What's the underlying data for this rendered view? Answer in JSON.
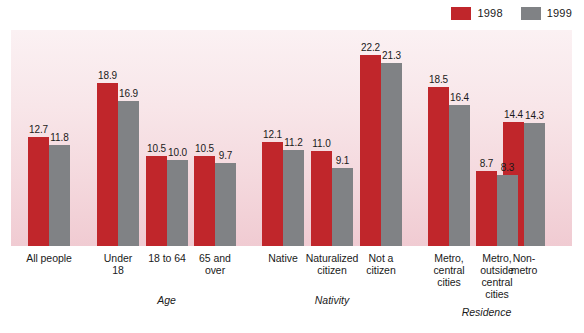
{
  "legend": {
    "items": [
      {
        "label": "1998",
        "color": "#c0262b",
        "name": "legend-swatch-1998"
      },
      {
        "label": "1999",
        "color": "#808285",
        "name": "legend-swatch-1999"
      }
    ]
  },
  "chart_data": {
    "type": "bar",
    "title": "",
    "subtitle": "",
    "xlabel": "",
    "ylabel": "",
    "ylim": [
      0,
      25
    ],
    "grid": false,
    "legend_position": "top-right",
    "categories": [
      "All people",
      "Under 18",
      "18 to 64",
      "65 and over",
      "Native",
      "Naturalized citizen",
      "Not a citizen",
      "Metro, central cities",
      "Metro, outside central cities",
      "Non-metro"
    ],
    "series": [
      {
        "name": "1998",
        "color": "#c0262b",
        "values": [
          12.7,
          18.9,
          10.5,
          10.5,
          12.1,
          11.0,
          22.2,
          18.5,
          8.7,
          14.4
        ]
      },
      {
        "name": "1999",
        "color": "#808285",
        "values": [
          11.8,
          16.9,
          10.0,
          9.7,
          11.2,
          9.1,
          21.3,
          16.4,
          8.3,
          14.3
        ]
      }
    ],
    "value_labels": {
      "1998": [
        "12.7",
        "18.9",
        "10.5",
        "10.5",
        "12.1",
        "11.0",
        "22.2",
        "18.5",
        "8.7",
        "14.4"
      ],
      "1999": [
        "11.8",
        "16.9",
        "10.0",
        "9.7",
        "11.2",
        "9.1",
        "21.3",
        "16.4",
        "8.3",
        "14.3"
      ]
    },
    "tick_labels": [
      {
        "lines": [
          "All people"
        ]
      },
      {
        "lines": [
          "Under",
          "18"
        ]
      },
      {
        "lines": [
          "18 to 64"
        ]
      },
      {
        "lines": [
          "65 and",
          "over"
        ]
      },
      {
        "lines": [
          "Native"
        ]
      },
      {
        "lines": [
          "Naturalized",
          "citizen"
        ]
      },
      {
        "lines": [
          "Not a",
          "citizen"
        ]
      },
      {
        "lines": [
          "Metro,",
          "central",
          "cities"
        ]
      },
      {
        "lines": [
          "Metro,",
          "outside",
          "central",
          "cities"
        ]
      },
      {
        "lines": [
          "Non-",
          "metro"
        ]
      }
    ],
    "group_labels": [
      "Age",
      "Nativity",
      "Residence"
    ],
    "annotations": []
  }
}
